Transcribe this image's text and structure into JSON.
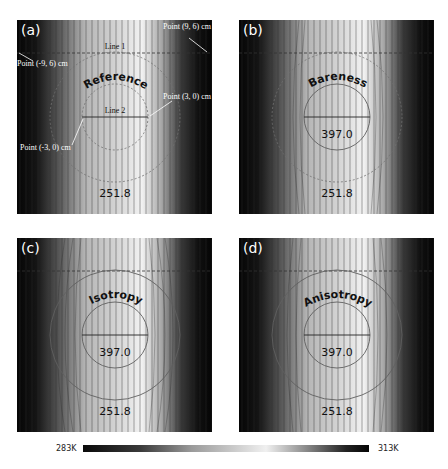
{
  "figure": {
    "panels": [
      {
        "id": "a",
        "tag": "(a)",
        "title": "Reference",
        "center_value": "",
        "bottom_value": "251.8",
        "inner_circle": "dashed",
        "outer_circle": "dashed",
        "annotations": {
          "line1": "Line 1",
          "line2": "Line 2",
          "point_tr": "Point (9, 6) cm",
          "point_tl": "Point (-9, 6) cm",
          "point_r": "Point (3, 0) cm",
          "point_l": "Point (-3, 0) cm"
        }
      },
      {
        "id": "b",
        "tag": "(b)",
        "title": "Bareness",
        "center_value": "397.0",
        "bottom_value": "251.8",
        "inner_circle": "solid",
        "outer_circle": "dashed"
      },
      {
        "id": "c",
        "tag": "(c)",
        "title": "Isotropy",
        "center_value": "397.0",
        "bottom_value": "251.8",
        "inner_circle": "solid",
        "outer_circle": "solid"
      },
      {
        "id": "d",
        "tag": "(d)",
        "title": "Anisotropy",
        "center_value": "397.0",
        "bottom_value": "251.8",
        "inner_circle": "solid",
        "outer_circle": "solid"
      }
    ],
    "colorbar": {
      "min_label": "283K",
      "max_label": "313K",
      "stops": [
        "#0a0a0a",
        "#3a3a3a",
        "#9a9a9a",
        "#c8c8c8",
        "#f0f0f0",
        "#9a9a9a",
        "#2a2a2a",
        "#050505"
      ]
    },
    "colors": {
      "isotherm": "#2b2b2b",
      "circle": "#6a6a6a",
      "label_text": "#111111",
      "annotation_text": "#ffffff"
    }
  }
}
